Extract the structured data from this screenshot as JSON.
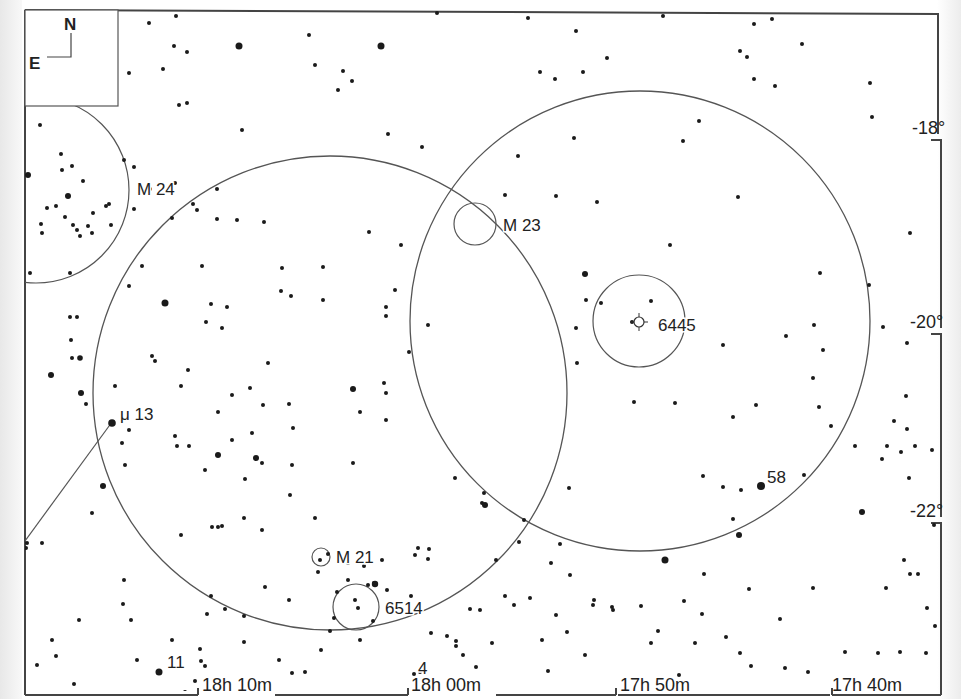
{
  "chart": {
    "credit": "Megastar",
    "compass": {
      "north": "N",
      "east": "E"
    },
    "ra_labels": [
      {
        "text": "18h 10m",
        "x": 202,
        "y": 691,
        "tick_x": 198
      },
      {
        "text": "18h 00m",
        "x": 411,
        "y": 691,
        "tick_x": 408
      },
      {
        "text": "17h 50m",
        "x": 620,
        "y": 691,
        "tick_x": 616
      },
      {
        "text": "17h 40m",
        "x": 832,
        "y": 691,
        "tick_x": 828
      }
    ],
    "dec_labels": [
      {
        "text": "-18°",
        "x": 912,
        "y": 134
      },
      {
        "text": "-20°",
        "x": 910,
        "y": 328
      },
      {
        "text": "-22°",
        "x": 910,
        "y": 517
      }
    ],
    "objects": [
      {
        "id": "m24",
        "label": "M 24",
        "lx": 137,
        "ly": 195
      },
      {
        "id": "m23",
        "label": "M 23",
        "lx": 503,
        "ly": 231
      },
      {
        "id": "ngc6445",
        "label": "6445",
        "lx": 658,
        "ly": 331
      },
      {
        "id": "mu13",
        "label": "μ  13",
        "lx": 120,
        "ly": 420
      },
      {
        "id": "m21",
        "label": "M 21",
        "lx": 336,
        "ly": 563
      },
      {
        "id": "ngc6514",
        "label": "6514",
        "lx": 385,
        "ly": 614
      },
      {
        "id": "s58",
        "label": "58",
        "lx": 767,
        "ly": 483
      },
      {
        "id": "s11",
        "label": "11",
        "lx": 167,
        "ly": 668
      },
      {
        "id": "s4",
        "label": "4",
        "lx": 418,
        "ly": 674
      }
    ],
    "circles": [
      {
        "name": "fov-circle-left",
        "cx": 330,
        "cy": 393,
        "r": 237,
        "kind": "fov"
      },
      {
        "name": "fov-circle-right",
        "cx": 640,
        "cy": 321,
        "r": 230,
        "kind": "fov"
      },
      {
        "name": "m24-circle",
        "cx": 36,
        "cy": 190,
        "r": 93,
        "kind": "obj"
      },
      {
        "name": "m23-circle",
        "cx": 475,
        "cy": 224,
        "r": 21,
        "kind": "obj"
      },
      {
        "name": "ngc6445-circle",
        "cx": 639,
        "cy": 321,
        "r": 46,
        "kind": "obj"
      },
      {
        "name": "m21-circle",
        "cx": 321,
        "cy": 557,
        "r": 9,
        "kind": "obj"
      },
      {
        "name": "ngc6514-circle",
        "cx": 356,
        "cy": 607,
        "r": 23,
        "kind": "obj"
      }
    ],
    "stars": [
      [
        149,
        23,
        2
      ],
      [
        176,
        16,
        2
      ],
      [
        174,
        46,
        2
      ],
      [
        187,
        52,
        2
      ],
      [
        129,
        73,
        2
      ],
      [
        163,
        69,
        2
      ],
      [
        239,
        46,
        3.5
      ],
      [
        179,
        105,
        2
      ],
      [
        187,
        103,
        2
      ],
      [
        242,
        130,
        2
      ],
      [
        309,
        35,
        2
      ],
      [
        315,
        65,
        2
      ],
      [
        343,
        71,
        2
      ],
      [
        352,
        81,
        2
      ],
      [
        338,
        90,
        2
      ],
      [
        381,
        46,
        3.5
      ],
      [
        388,
        134,
        2
      ],
      [
        422,
        147,
        2
      ],
      [
        437,
        13,
        2
      ],
      [
        528,
        18,
        2
      ],
      [
        576,
        31,
        2
      ],
      [
        607,
        58,
        2
      ],
      [
        583,
        72,
        2
      ],
      [
        540,
        72,
        2
      ],
      [
        555,
        79,
        2
      ],
      [
        663,
        16,
        2
      ],
      [
        754,
        24,
        2
      ],
      [
        772,
        19,
        2
      ],
      [
        740,
        51,
        2
      ],
      [
        747,
        57,
        2
      ],
      [
        754,
        79,
        2
      ],
      [
        775,
        86,
        2
      ],
      [
        802,
        44,
        2
      ],
      [
        870,
        83,
        2
      ],
      [
        699,
        121,
        2
      ],
      [
        683,
        141,
        2
      ],
      [
        574,
        138,
        2
      ],
      [
        518,
        156,
        2
      ],
      [
        505,
        195,
        2
      ],
      [
        556,
        196,
        2
      ],
      [
        597,
        202,
        2
      ],
      [
        670,
        245,
        2
      ],
      [
        738,
        197,
        2
      ],
      [
        872,
        117,
        2
      ],
      [
        910,
        233,
        2
      ],
      [
        40,
        125,
        2
      ],
      [
        61,
        154,
        2
      ],
      [
        72,
        166,
        2
      ],
      [
        68,
        196,
        3
      ],
      [
        62,
        170,
        2
      ],
      [
        83,
        181,
        2
      ],
      [
        93,
        213,
        2
      ],
      [
        88,
        226,
        2
      ],
      [
        106,
        206,
        2
      ],
      [
        109,
        204,
        2
      ],
      [
        111,
        225,
        2
      ],
      [
        47,
        208,
        2
      ],
      [
        56,
        206,
        2
      ],
      [
        41,
        224,
        2
      ],
      [
        65,
        217,
        2
      ],
      [
        73,
        225,
        2
      ],
      [
        77,
        230,
        2
      ],
      [
        80,
        236,
        2
      ],
      [
        42,
        233,
        2
      ],
      [
        92,
        233,
        2
      ],
      [
        28,
        175,
        3
      ],
      [
        30,
        273,
        2
      ],
      [
        70,
        273,
        2
      ],
      [
        124,
        160,
        2
      ],
      [
        134,
        167,
        2
      ],
      [
        134,
        209,
        2
      ],
      [
        172,
        218,
        2
      ],
      [
        197,
        210,
        2
      ],
      [
        217,
        219,
        2
      ],
      [
        237,
        220,
        2
      ],
      [
        264,
        222,
        2
      ],
      [
        217,
        189,
        2
      ],
      [
        175,
        183,
        2
      ],
      [
        193,
        204,
        2
      ],
      [
        150,
        189,
        2
      ],
      [
        165,
        303,
        3.5
      ],
      [
        211,
        304,
        2
      ],
      [
        227,
        307,
        2
      ],
      [
        206,
        322,
        2
      ],
      [
        222,
        328,
        2
      ],
      [
        142,
        266,
        2
      ],
      [
        129,
        286,
        2
      ],
      [
        202,
        266,
        2
      ],
      [
        282,
        268,
        2
      ],
      [
        323,
        267,
        2
      ],
      [
        281,
        291,
        2
      ],
      [
        291,
        296,
        2
      ],
      [
        323,
        300,
        2
      ],
      [
        369,
        232,
        2
      ],
      [
        401,
        245,
        2
      ],
      [
        395,
        290,
        2
      ],
      [
        386,
        307,
        2
      ],
      [
        386,
        316,
        2
      ],
      [
        428,
        325,
        2
      ],
      [
        409,
        352,
        2
      ],
      [
        268,
        363,
        2
      ],
      [
        250,
        388,
        2
      ],
      [
        232,
        395,
        2
      ],
      [
        188,
        370,
        2
      ],
      [
        181,
        386,
        2
      ],
      [
        152,
        356,
        2
      ],
      [
        155,
        361,
        2
      ],
      [
        115,
        386,
        2
      ],
      [
        129,
        430,
        2
      ],
      [
        125,
        465,
        2
      ],
      [
        70,
        317,
        2
      ],
      [
        77,
        317,
        2
      ],
      [
        71,
        340,
        2
      ],
      [
        72,
        358,
        2
      ],
      [
        80,
        358,
        2.8
      ],
      [
        51,
        375,
        3
      ],
      [
        81,
        393,
        3
      ],
      [
        86,
        404,
        2
      ],
      [
        112,
        423,
        3.8
      ],
      [
        122,
        443,
        2
      ],
      [
        103,
        486,
        3
      ],
      [
        92,
        513,
        2
      ],
      [
        42,
        543,
        2
      ],
      [
        27,
        543,
        2
      ],
      [
        26,
        548,
        2
      ],
      [
        175,
        436,
        2
      ],
      [
        177,
        446,
        2
      ],
      [
        189,
        446,
        2
      ],
      [
        218,
        412,
        2
      ],
      [
        232,
        440,
        2
      ],
      [
        218,
        455,
        3
      ],
      [
        256,
        458,
        3
      ],
      [
        262,
        463,
        2
      ],
      [
        205,
        470,
        2
      ],
      [
        252,
        433,
        2
      ],
      [
        292,
        465,
        2
      ],
      [
        290,
        495,
        2
      ],
      [
        245,
        479,
        2
      ],
      [
        262,
        530,
        2
      ],
      [
        212,
        527,
        2
      ],
      [
        218,
        527,
        2
      ],
      [
        222,
        526,
        2
      ],
      [
        244,
        518,
        2
      ],
      [
        181,
        535,
        2
      ],
      [
        263,
        405,
        2
      ],
      [
        289,
        404,
        2
      ],
      [
        293,
        428,
        2
      ],
      [
        353,
        389,
        3
      ],
      [
        360,
        412,
        2
      ],
      [
        386,
        393,
        2
      ],
      [
        384,
        383,
        2
      ],
      [
        386,
        420,
        2
      ],
      [
        353,
        463,
        2
      ],
      [
        315,
        518,
        2
      ],
      [
        328,
        554,
        2
      ],
      [
        320,
        560,
        2
      ],
      [
        348,
        563,
        2
      ],
      [
        343,
        560,
        2
      ],
      [
        364,
        566,
        2
      ],
      [
        382,
        560,
        2
      ],
      [
        418,
        548,
        2
      ],
      [
        429,
        549,
        2
      ],
      [
        428,
        559,
        2
      ],
      [
        374,
        583,
        2
      ],
      [
        368,
        585,
        2
      ],
      [
        348,
        580,
        2
      ],
      [
        318,
        572,
        2
      ],
      [
        337,
        592,
        2
      ],
      [
        355,
        600,
        2
      ],
      [
        358,
        608,
        2
      ],
      [
        334,
        618,
        2
      ],
      [
        373,
        621,
        2
      ],
      [
        387,
        590,
        2
      ],
      [
        375,
        584,
        3.2
      ],
      [
        415,
        555,
        2
      ],
      [
        455,
        478,
        2
      ],
      [
        484,
        493,
        2
      ],
      [
        482,
        503,
        2
      ],
      [
        524,
        520,
        2
      ],
      [
        519,
        542,
        2
      ],
      [
        585,
        274,
        3
      ],
      [
        586,
        300,
        2
      ],
      [
        576,
        328,
        2
      ],
      [
        601,
        303,
        2
      ],
      [
        651,
        301,
        2
      ],
      [
        632,
        322,
        2
      ],
      [
        577,
        363,
        2
      ],
      [
        634,
        402,
        2
      ],
      [
        675,
        403,
        2
      ],
      [
        723,
        345,
        2
      ],
      [
        786,
        336,
        2
      ],
      [
        814,
        325,
        2
      ],
      [
        820,
        273,
        2
      ],
      [
        869,
        285,
        2
      ],
      [
        883,
        327,
        2
      ],
      [
        907,
        343,
        2
      ],
      [
        906,
        396,
        2
      ],
      [
        894,
        421,
        2
      ],
      [
        907,
        429,
        2
      ],
      [
        915,
        446,
        2
      ],
      [
        901,
        452,
        2
      ],
      [
        909,
        478,
        2
      ],
      [
        823,
        350,
        2
      ],
      [
        756,
        405,
        2
      ],
      [
        733,
        417,
        2
      ],
      [
        703,
        476,
        2
      ],
      [
        723,
        487,
        2
      ],
      [
        741,
        490,
        2
      ],
      [
        761,
        486,
        4
      ],
      [
        733,
        519,
        2
      ],
      [
        739,
        535,
        3
      ],
      [
        665,
        560,
        3.5
      ],
      [
        704,
        574,
        2
      ],
      [
        749,
        589,
        2
      ],
      [
        813,
        588,
        2
      ],
      [
        886,
        588,
        2
      ],
      [
        910,
        574,
        2
      ],
      [
        918,
        574,
        2
      ],
      [
        862,
        512,
        3
      ],
      [
        934,
        525,
        2
      ],
      [
        932,
        450,
        2
      ],
      [
        551,
        563,
        2
      ],
      [
        570,
        575,
        2
      ],
      [
        594,
        600,
        2
      ],
      [
        613,
        610,
        2
      ],
      [
        684,
        601,
        2
      ],
      [
        702,
        614,
        2
      ],
      [
        726,
        637,
        2
      ],
      [
        740,
        653,
        2
      ],
      [
        658,
        631,
        2
      ],
      [
        641,
        606,
        2
      ],
      [
        651,
        643,
        2
      ],
      [
        593,
        605,
        2
      ],
      [
        514,
        605,
        2
      ],
      [
        492,
        643,
        2
      ],
      [
        542,
        640,
        2
      ],
      [
        447,
        636,
        2
      ],
      [
        420,
        672,
        2
      ],
      [
        567,
        632,
        2
      ],
      [
        780,
        619,
        2
      ],
      [
        878,
        653,
        2
      ],
      [
        808,
        672,
        2
      ],
      [
        612,
        607,
        2
      ],
      [
        556,
        615,
        2
      ],
      [
        585,
        655,
        2
      ],
      [
        456,
        646,
        2
      ],
      [
        52,
        640,
        2
      ],
      [
        37,
        665,
        2
      ],
      [
        56,
        656,
        2
      ],
      [
        79,
        620,
        2
      ],
      [
        74,
        684,
        2
      ],
      [
        123,
        604,
        2
      ],
      [
        124,
        580,
        2
      ],
      [
        131,
        620,
        2
      ],
      [
        172,
        640,
        2
      ],
      [
        137,
        660,
        2
      ],
      [
        159,
        672,
        3.5
      ],
      [
        200,
        649,
        2
      ],
      [
        201,
        661,
        2
      ],
      [
        205,
        666,
        2
      ],
      [
        195,
        681,
        2
      ],
      [
        185,
        692,
        2
      ],
      [
        207,
        614,
        2
      ],
      [
        211,
        596,
        2
      ],
      [
        225,
        609,
        2
      ],
      [
        244,
        616,
        2
      ],
      [
        292,
        673,
        2
      ],
      [
        305,
        672,
        2
      ],
      [
        321,
        650,
        2
      ],
      [
        330,
        631,
        2
      ],
      [
        265,
        587,
        2
      ],
      [
        289,
        600,
        2
      ],
      [
        244,
        642,
        2
      ],
      [
        279,
        660,
        2
      ],
      [
        360,
        640,
        2
      ],
      [
        431,
        633,
        2
      ],
      [
        480,
        610,
        2
      ],
      [
        411,
        596,
        2
      ],
      [
        496,
        560,
        2
      ],
      [
        569,
        488,
        2
      ],
      [
        560,
        544,
        2
      ],
      [
        485,
        505,
        3
      ],
      [
        505,
        596,
        2
      ],
      [
        530,
        598,
        2
      ],
      [
        456,
        641,
        2
      ],
      [
        470,
        609,
        2
      ],
      [
        463,
        655,
        2
      ],
      [
        414,
        674,
        2
      ],
      [
        476,
        667,
        2
      ],
      [
        548,
        671,
        2
      ],
      [
        679,
        675,
        2
      ],
      [
        695,
        643,
        2
      ],
      [
        751,
        666,
        2
      ],
      [
        785,
        668,
        2
      ],
      [
        900,
        652,
        2
      ],
      [
        926,
        653,
        2
      ],
      [
        927,
        608,
        2
      ],
      [
        935,
        626,
        2
      ],
      [
        845,
        652,
        2
      ],
      [
        904,
        560,
        2
      ],
      [
        855,
        446,
        2
      ],
      [
        887,
        446,
        2
      ],
      [
        882,
        459,
        2
      ],
      [
        831,
        426,
        2
      ],
      [
        804,
        475,
        2
      ],
      [
        819,
        407,
        2
      ],
      [
        813,
        378,
        2
      ]
    ]
  }
}
